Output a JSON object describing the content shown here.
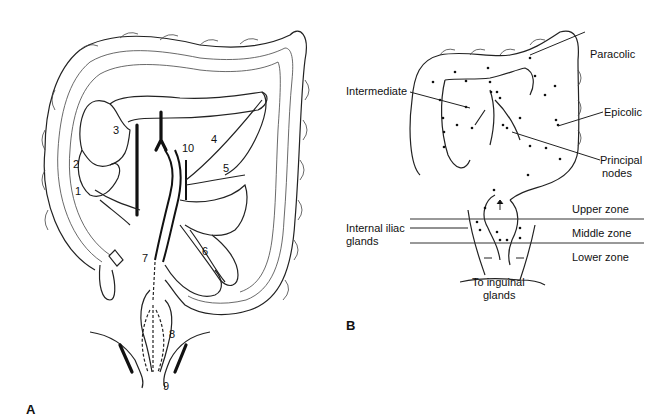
{
  "figure_a": {
    "panel_label": "A",
    "numbers": [
      {
        "id": "1",
        "label": "1"
      },
      {
        "id": "2",
        "label": "2"
      },
      {
        "id": "3",
        "label": "3"
      },
      {
        "id": "4",
        "label": "4"
      },
      {
        "id": "5",
        "label": "5"
      },
      {
        "id": "6",
        "label": "6"
      },
      {
        "id": "7",
        "label": "7"
      },
      {
        "id": "8",
        "label": "8"
      },
      {
        "id": "9",
        "label": "9"
      },
      {
        "id": "10",
        "label": "10"
      }
    ]
  },
  "figure_b": {
    "panel_label": "B",
    "labels": {
      "paracolic": "Paracolic",
      "intermediate": "Intermediate",
      "epicolic": "Epicolic",
      "principal_line1": "Principal",
      "principal_line2": "nodes",
      "upper_zone": "Upper zone",
      "middle_zone": "Middle zone",
      "lower_zone": "Lower zone",
      "internal_iliac_line1": "Internal iliac",
      "internal_iliac_line2": "glands",
      "inguinal_line1": "To inguinal",
      "inguinal_line2": "glands"
    }
  }
}
